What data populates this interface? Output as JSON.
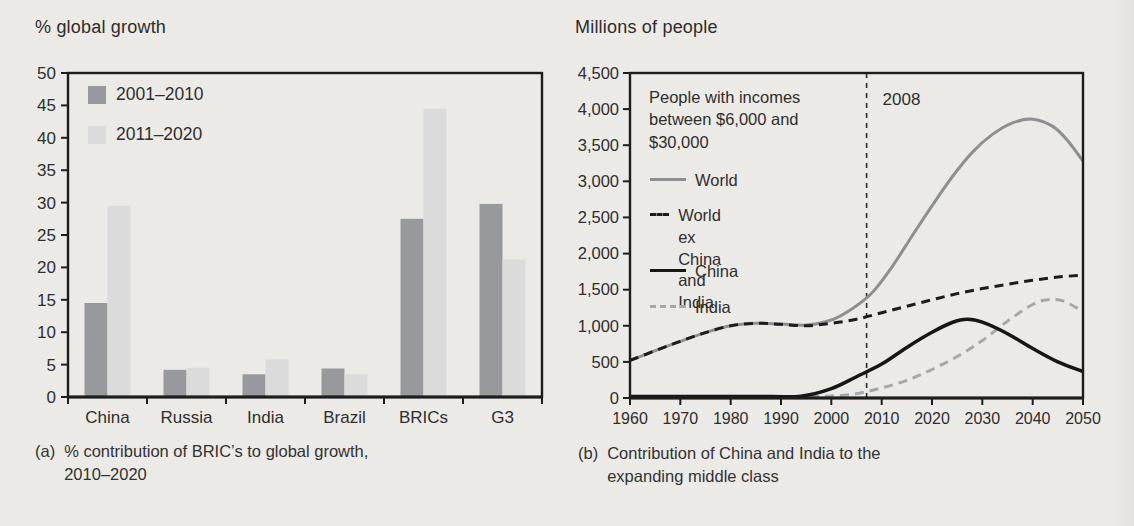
{
  "page": {
    "background": "#eceae6",
    "axis_color": "#1d1d1d",
    "text_color": "#2e2e2e"
  },
  "chart_data": [
    {
      "type": "bar",
      "title": "% global growth",
      "caption_label": "(a)",
      "caption_line1": "% contribution of BRIC’s to global growth,",
      "caption_line2": "2010–2020",
      "categories": [
        "China",
        "Russia",
        "India",
        "Brazil",
        "BRICs",
        "G3"
      ],
      "series": [
        {
          "name": "2001–2010",
          "color": "#98999d",
          "values": [
            14.5,
            4.2,
            3.5,
            4.4,
            27.5,
            29.8
          ]
        },
        {
          "name": "2011–2020",
          "color": "#dbdbdb",
          "values": [
            29.5,
            4.5,
            5.8,
            3.5,
            44.5,
            21.2
          ]
        }
      ],
      "ylim": [
        0,
        50
      ],
      "yticks": [
        0,
        5,
        10,
        15,
        20,
        25,
        30,
        35,
        40,
        45,
        50
      ],
      "grid": false,
      "legend_position": "top-left-inside"
    },
    {
      "type": "line",
      "title": "Millions of people",
      "caption_label": "(b)",
      "caption_line1": "Contribution of China and India to the",
      "caption_line2": "expanding middle class",
      "annotation_line1": "People with incomes",
      "annotation_line2": "between $6,000 and",
      "annotation_line3": "$30,000",
      "vline": {
        "x": 2007,
        "label": "2008"
      },
      "xlim": [
        1960,
        2050
      ],
      "ylim": [
        0,
        4500
      ],
      "xticks": [
        1960,
        1970,
        1980,
        1990,
        2000,
        2010,
        2020,
        2030,
        2040,
        2050
      ],
      "ytick_labels": [
        "0",
        "500",
        "1,000",
        "1,500",
        "2,000",
        "2,500",
        "3,000",
        "3,500",
        "4,000",
        "4,500"
      ],
      "grid": false,
      "series": [
        {
          "name": "World",
          "color": "#8e8f91",
          "dash": null,
          "width": 3,
          "points": [
            [
              1960,
              520
            ],
            [
              1965,
              655
            ],
            [
              1970,
              785
            ],
            [
              1975,
              905
            ],
            [
              1980,
              1000
            ],
            [
              1985,
              1035
            ],
            [
              1990,
              1025
            ],
            [
              1995,
              1010
            ],
            [
              2000,
              1080
            ],
            [
              2004,
              1230
            ],
            [
              2008,
              1450
            ],
            [
              2012,
              1810
            ],
            [
              2016,
              2240
            ],
            [
              2020,
              2660
            ],
            [
              2024,
              3060
            ],
            [
              2028,
              3400
            ],
            [
              2032,
              3650
            ],
            [
              2036,
              3810
            ],
            [
              2040,
              3860
            ],
            [
              2044,
              3760
            ],
            [
              2047,
              3560
            ],
            [
              2050,
              3280
            ]
          ]
        },
        {
          "name": "India",
          "color": "#a6a7a9",
          "dash": "9 6",
          "width": 3,
          "points": [
            [
              1960,
              3
            ],
            [
              1970,
              3
            ],
            [
              1980,
              3
            ],
            [
              1990,
              6
            ],
            [
              1996,
              12
            ],
            [
              2000,
              28
            ],
            [
              2005,
              60
            ],
            [
              2010,
              140
            ],
            [
              2015,
              245
            ],
            [
              2020,
              395
            ],
            [
              2025,
              575
            ],
            [
              2030,
              795
            ],
            [
              2035,
              1065
            ],
            [
              2040,
              1295
            ],
            [
              2043,
              1360
            ],
            [
              2046,
              1345
            ],
            [
              2050,
              1200
            ]
          ]
        },
        {
          "name": "China",
          "color": "#161616",
          "dash": null,
          "width": 3.5,
          "points": [
            [
              1960,
              6
            ],
            [
              1970,
              6
            ],
            [
              1980,
              6
            ],
            [
              1988,
              8
            ],
            [
              1994,
              25
            ],
            [
              2000,
              130
            ],
            [
              2005,
              295
            ],
            [
              2010,
              470
            ],
            [
              2015,
              700
            ],
            [
              2020,
              910
            ],
            [
              2024,
              1045
            ],
            [
              2027,
              1090
            ],
            [
              2030,
              1050
            ],
            [
              2035,
              890
            ],
            [
              2040,
              685
            ],
            [
              2045,
              500
            ],
            [
              2050,
              365
            ]
          ]
        },
        {
          "name": "World ex China and India",
          "color": "#1c1c1c",
          "dash": "9 6",
          "width": 3,
          "points": [
            [
              1960,
              520
            ],
            [
              1965,
              655
            ],
            [
              1970,
              785
            ],
            [
              1975,
              905
            ],
            [
              1980,
              1000
            ],
            [
              1985,
              1035
            ],
            [
              1990,
              1020
            ],
            [
              1995,
              1000
            ],
            [
              2000,
              1035
            ],
            [
              2005,
              1090
            ],
            [
              2010,
              1180
            ],
            [
              2015,
              1270
            ],
            [
              2020,
              1360
            ],
            [
              2025,
              1445
            ],
            [
              2030,
              1515
            ],
            [
              2035,
              1575
            ],
            [
              2040,
              1630
            ],
            [
              2045,
              1675
            ],
            [
              2050,
              1700
            ]
          ]
        }
      ],
      "legend": [
        {
          "label": "World",
          "label2": "",
          "line_style": "solid",
          "color": "#8e8f91",
          "top": 170
        },
        {
          "label": "World ex China",
          "label2": "and India",
          "line_style": "dashed",
          "color": "#1c1c1c",
          "top": 205
        },
        {
          "label": "China",
          "label2": "",
          "line_style": "solid",
          "color": "#161616",
          "top": 261
        },
        {
          "label": "India",
          "label2": "",
          "line_style": "dashed",
          "color": "#a6a7a9",
          "top": 297
        }
      ],
      "legend_position": "left-inside"
    }
  ]
}
